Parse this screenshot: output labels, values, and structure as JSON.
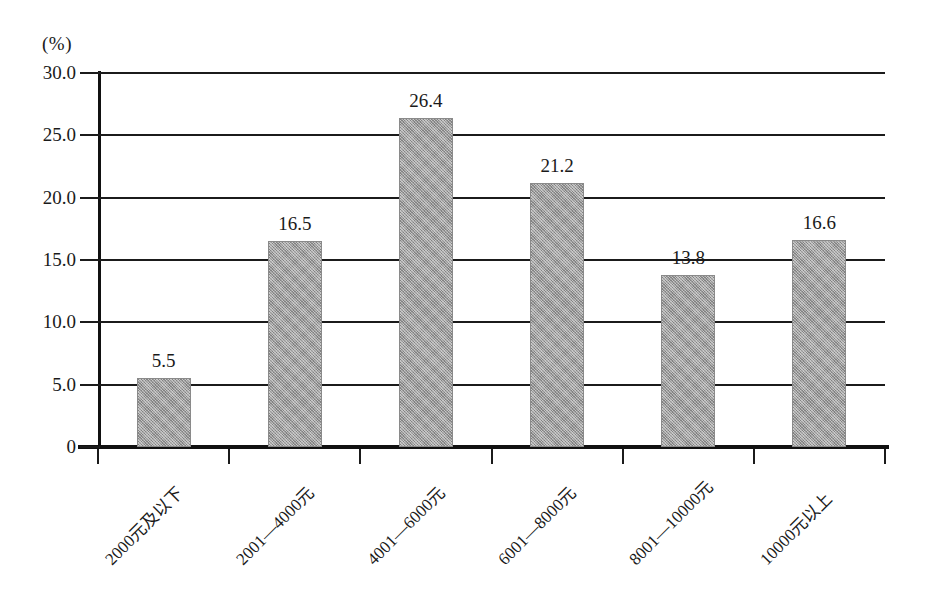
{
  "chart_data": {
    "type": "bar",
    "title": "",
    "subtitle": "",
    "unit_label": "(%)",
    "xlabel": "",
    "ylabel": "",
    "ylim": [
      0,
      30
    ],
    "grid": true,
    "legend": "none",
    "categories": [
      "2000元及以下",
      "2001—4000元",
      "4001—6000元",
      "6001—8000元",
      "8001—10000元",
      "10000元以上"
    ],
    "values": [
      5.5,
      16.5,
      26.4,
      21.2,
      13.8,
      16.6
    ],
    "value_labels": [
      "5.5",
      "16.5",
      "26.4",
      "21.2",
      "13.8",
      "16.6"
    ],
    "ytick_labels": [
      "30.0",
      "25.0",
      "20.0",
      "15.0",
      "10.0",
      "5.0",
      "0"
    ],
    "ytick_values": [
      30,
      25,
      20,
      15,
      10,
      5,
      0
    ],
    "bar_color": "#9a9a9a",
    "axis_color": "#1b1b1b",
    "background_color": "#ffffff"
  }
}
